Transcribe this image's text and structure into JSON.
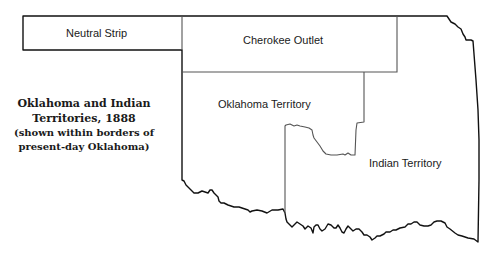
{
  "map": {
    "title_line1": "Oklahoma and Indian",
    "title_line2": "Territories, 1888",
    "subtitle_line1": "(shown within borders of",
    "subtitle_line2": "present-day Oklahoma)",
    "regions": [
      {
        "name": "Neutral Strip",
        "label": "Neutral Strip"
      },
      {
        "name": "Cherokee Outlet",
        "label": "Cherokee Outlet"
      },
      {
        "name": "Oklahoma Territory",
        "label": "Oklahoma Territory"
      },
      {
        "name": "Indian Territory",
        "label": "Indian Territory"
      }
    ],
    "colors": {
      "outline": "#111111",
      "internal_border": "#555555",
      "background": "#ffffff"
    }
  }
}
